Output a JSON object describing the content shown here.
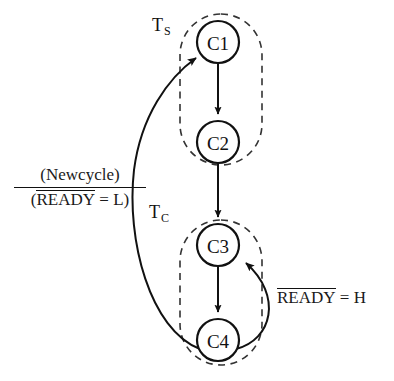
{
  "figure": {
    "type": "state-transition-diagram",
    "background_color": "#ffffff",
    "ink_color": "#111111"
  },
  "states": [
    {
      "id": "C1",
      "label": "C1",
      "cx": 218,
      "cy": 42,
      "r": 21,
      "group": "TS"
    },
    {
      "id": "C2",
      "label": "C2",
      "cx": 218,
      "cy": 142,
      "r": 21,
      "group": "TS"
    },
    {
      "id": "C3",
      "label": "C3",
      "cx": 218,
      "cy": 245,
      "r": 21,
      "group": "TC"
    },
    {
      "id": "C4",
      "label": "C4",
      "cx": 218,
      "cy": 340,
      "r": 21,
      "group": "TC"
    }
  ],
  "groups": [
    {
      "id": "TS",
      "label_main": "T",
      "label_sub": "S",
      "members": [
        "C1",
        "C2"
      ],
      "box": {
        "x": 180,
        "y": 14,
        "width": 82,
        "height": 151,
        "radius": 41
      },
      "stroke": "dashed"
    },
    {
      "id": "TC",
      "label_main": "T",
      "label_sub": "C",
      "members": [
        "C3",
        "C4"
      ],
      "box": {
        "x": 180,
        "y": 220,
        "width": 82,
        "height": 145,
        "radius": 41
      },
      "stroke": "dashed"
    }
  ],
  "transitions": [
    {
      "id": "c1-c2",
      "from": "C1",
      "to": "C2",
      "shape": "straight",
      "label": ""
    },
    {
      "id": "c2-c3",
      "from": "C2",
      "to": "C3",
      "shape": "straight",
      "label": ""
    },
    {
      "id": "c3-c4",
      "from": "C3",
      "to": "C4",
      "shape": "straight",
      "label": ""
    },
    {
      "id": "c4-c3",
      "from": "C4",
      "to": "C3",
      "shape": "curve-right",
      "label_id": "ready-h"
    },
    {
      "id": "c4-c1",
      "from": "C4",
      "to": "C1",
      "shape": "curve-left",
      "label_id": "newcycle"
    }
  ],
  "edge_labels": {
    "newcycle": {
      "numerator": "(Newcycle)",
      "denominator_open": "(",
      "denominator_overlined": "READY",
      "denominator_rest": " = L)",
      "has_fraction_bar": true
    },
    "ready_h": {
      "overlined": "READY",
      "rest": " = H"
    }
  }
}
